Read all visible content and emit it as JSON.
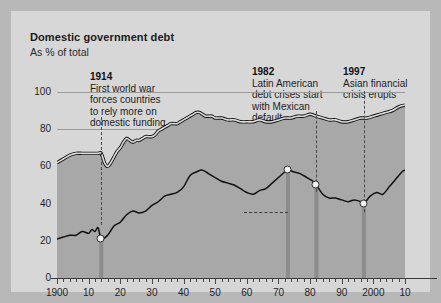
{
  "header": {
    "title": "Domestic government debt",
    "subtitle": "As % of total"
  },
  "annotations": [
    {
      "id": "a1914",
      "year": "1914",
      "lines": [
        "First world war",
        "forces countries",
        "to rely more on",
        "domestic funding"
      ]
    },
    {
      "id": "a1982",
      "year": "1982",
      "lines": [
        "Latin American",
        "debt crises start",
        "with Mexican",
        "default"
      ]
    },
    {
      "id": "a1997",
      "year": "1997",
      "lines": [
        "Asian financial",
        "crisis erupts"
      ]
    },
    {
      "id": "a1973",
      "year": "1973",
      "lines": [
        "Recycled",
        "petrodollars begin",
        "to pour into",
        "emerging markets"
      ]
    }
  ],
  "series_labels": {
    "advanced": [
      "Advanced",
      "economies"
    ],
    "emerging": [
      "Emerging",
      "economies"
    ]
  },
  "chart_data": {
    "type": "area",
    "title": "Domestic government debt",
    "subtitle": "As % of total",
    "xlabel": "",
    "ylabel": "As % of total",
    "ylim": [
      0,
      100
    ],
    "xlim": [
      1900,
      2010
    ],
    "yticks": [
      0,
      20,
      40,
      60,
      80,
      100
    ],
    "ytick_labels": [
      "0",
      "20",
      "40",
      "60",
      "80",
      "100"
    ],
    "xticks": [
      1900,
      1910,
      1920,
      1930,
      1940,
      1950,
      1960,
      1970,
      1980,
      1990,
      2000,
      2010
    ],
    "xtick_labels": [
      "1900",
      "10",
      "20",
      "30",
      "40",
      "50",
      "60",
      "70",
      "80",
      "90",
      "2000",
      "10"
    ],
    "grid": true,
    "legend": "inline-labels",
    "colors": {
      "panel": "#d7d7d7",
      "fill": "#a8a8a8",
      "line": "#111111",
      "event_bar": "#8c8c8c",
      "dot": "#f2f2f2"
    },
    "event_markers": [
      {
        "year": 1914,
        "label": "1914",
        "dot_value": 21
      },
      {
        "year": 1973,
        "label": "1973",
        "dot_value": 58
      },
      {
        "year": 1982,
        "label": "1982",
        "dot_value": 50
      },
      {
        "year": 1997,
        "label": "1997",
        "dot_value": 40
      }
    ],
    "series": [
      {
        "name": "Advanced economies",
        "x": [
          1900,
          1902,
          1904,
          1906,
          1908,
          1910,
          1911,
          1912,
          1913,
          1914,
          1915,
          1916,
          1917,
          1918,
          1919,
          1920,
          1921,
          1922,
          1923,
          1924,
          1925,
          1926,
          1927,
          1928,
          1929,
          1930,
          1931,
          1932,
          1933,
          1934,
          1935,
          1936,
          1937,
          1938,
          1939,
          1940,
          1941,
          1942,
          1943,
          1944,
          1945,
          1946,
          1947,
          1948,
          1949,
          1950,
          1952,
          1954,
          1956,
          1958,
          1960,
          1962,
          1964,
          1966,
          1968,
          1970,
          1972,
          1974,
          1976,
          1978,
          1980,
          1982,
          1984,
          1986,
          1988,
          1990,
          1992,
          1994,
          1996,
          1998,
          2000,
          2002,
          2004,
          2006,
          2008,
          2010
        ],
        "y": [
          62,
          64,
          66,
          67,
          67,
          67,
          67,
          67,
          67,
          67,
          62,
          60,
          62,
          65,
          68,
          70,
          73,
          75,
          74,
          73,
          74,
          74,
          75,
          76,
          76,
          76,
          77,
          79,
          80,
          81,
          82,
          83,
          83,
          83,
          84,
          85,
          86,
          87,
          88,
          89,
          89,
          88,
          87,
          87,
          87,
          86,
          86,
          85,
          85,
          84,
          84,
          84,
          85,
          84,
          84,
          85,
          86,
          86,
          87,
          87,
          88,
          87,
          86,
          85,
          85,
          84,
          84,
          85,
          86,
          86,
          87,
          88,
          89,
          90,
          92,
          93
        ],
        "style": "filled-area-with-outline"
      },
      {
        "name": "Emerging economies",
        "x": [
          1900,
          1902,
          1904,
          1906,
          1908,
          1910,
          1911,
          1912,
          1913,
          1914,
          1916,
          1918,
          1920,
          1922,
          1924,
          1926,
          1928,
          1930,
          1932,
          1934,
          1936,
          1938,
          1940,
          1942,
          1944,
          1946,
          1948,
          1950,
          1952,
          1954,
          1956,
          1958,
          1960,
          1962,
          1964,
          1966,
          1968,
          1970,
          1972,
          1973,
          1975,
          1977,
          1979,
          1981,
          1982,
          1984,
          1986,
          1988,
          1990,
          1992,
          1994,
          1996,
          1997,
          1999,
          2001,
          2003,
          2005,
          2007,
          2009,
          2010
        ],
        "y": [
          21,
          22,
          23,
          23,
          25,
          24,
          26,
          25,
          27,
          21,
          23,
          28,
          30,
          34,
          36,
          35,
          36,
          39,
          41,
          44,
          45,
          46,
          49,
          55,
          57,
          58,
          56,
          54,
          52,
          51,
          50,
          48,
          46,
          45,
          47,
          48,
          51,
          54,
          57,
          58,
          57,
          56,
          54,
          52,
          50,
          45,
          43,
          43,
          42,
          41,
          42,
          41,
          40,
          44,
          46,
          45,
          49,
          53,
          57,
          58
        ],
        "style": "line"
      }
    ]
  }
}
